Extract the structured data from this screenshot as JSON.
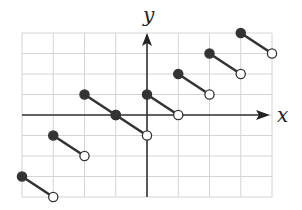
{
  "chart_data": {
    "type": "line",
    "title": "",
    "xlabel": "x",
    "ylabel": "y",
    "xlim": [
      -4,
      4
    ],
    "ylim": [
      -4,
      4
    ],
    "grid": true,
    "grid_step": 1,
    "tick_labels": false,
    "segments": [
      {
        "start": [
          -4,
          -3
        ],
        "end": [
          -3,
          -4
        ],
        "start_closed": true,
        "end_closed": false
      },
      {
        "start": [
          -3,
          -1
        ],
        "end": [
          -2,
          -2
        ],
        "start_closed": true,
        "end_closed": false
      },
      {
        "start": [
          -2,
          1
        ],
        "end": [
          -1,
          0
        ],
        "start_closed": true,
        "end_closed": false
      },
      {
        "start": [
          -1,
          0
        ],
        "end": [
          0,
          -1
        ],
        "start_closed": true,
        "end_closed": false
      },
      {
        "start": [
          0,
          1
        ],
        "end": [
          1,
          0
        ],
        "start_closed": true,
        "end_closed": false
      },
      {
        "start": [
          1,
          2
        ],
        "end": [
          2,
          1
        ],
        "start_closed": true,
        "end_closed": false
      },
      {
        "start": [
          2,
          3
        ],
        "end": [
          3,
          2
        ],
        "start_closed": true,
        "end_closed": false
      },
      {
        "start": [
          3,
          4
        ],
        "end": [
          4,
          3
        ],
        "start_closed": true,
        "end_closed": false
      }
    ]
  },
  "labels": {
    "x_axis": "x",
    "y_axis": "y"
  },
  "colors": {
    "grid": "#d4d4d4",
    "axis": "#333333",
    "segment": "#333333",
    "open_fill": "#ffffff"
  }
}
